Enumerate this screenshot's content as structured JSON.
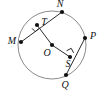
{
  "figure": {
    "name": "circle-with-two-perpendicular-chords",
    "background_color": "#ffffff",
    "stroke_color": "#2b2b2b",
    "circle_color": "#8a8a8a",
    "label_color": "#111111"
  },
  "circle": {
    "center_label": "O",
    "center_x": 52,
    "center_y": 45,
    "radius": 34
  },
  "points": [
    {
      "label": "N",
      "x": 62,
      "y": 12,
      "label_x": 60,
      "label_y": 5,
      "role": "chord-endpoint-on-circle"
    },
    {
      "label": "M",
      "x": 21,
      "y": 42,
      "label_x": 12,
      "label_y": 42,
      "role": "chord-endpoint-on-circle"
    },
    {
      "label": "T",
      "x": 37,
      "y": 25,
      "label_x": 44,
      "label_y": 23,
      "role": "perpendicular-foot-on-chord-MN"
    },
    {
      "label": "P",
      "x": 85,
      "y": 38,
      "label_x": 92,
      "label_y": 37,
      "role": "chord-endpoint-on-circle"
    },
    {
      "label": "Q",
      "x": 66,
      "y": 75,
      "label_x": 65,
      "label_y": 86,
      "role": "chord-endpoint-on-circle"
    },
    {
      "label": "S",
      "x": 70,
      "y": 57,
      "label_x": 68,
      "label_y": 65,
      "role": "perpendicular-foot-on-chord-PQ"
    },
    {
      "label": "O",
      "x": 52,
      "y": 45,
      "label_x": 48,
      "label_y": 54,
      "role": "circle-center"
    }
  ],
  "segments": [
    {
      "name": "chord-MN",
      "from": "M",
      "to": "N"
    },
    {
      "name": "radius-OT",
      "from": "O",
      "to": "T"
    },
    {
      "name": "chord-PQ",
      "from": "P",
      "to": "Q"
    },
    {
      "name": "radius-OS",
      "from": "O",
      "to": "S"
    }
  ],
  "right_angles": [
    {
      "name": "right-angle-at-T",
      "at": "T"
    },
    {
      "name": "right-angle-at-S",
      "at": "S"
    }
  ]
}
